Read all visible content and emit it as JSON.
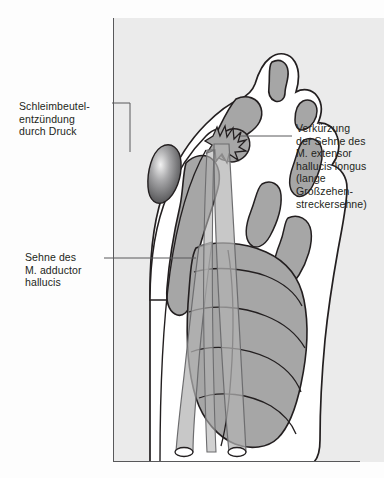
{
  "illustration": {
    "subject": "hallux-valgus-foot-dorsal-view",
    "panel_background": "#ebebeb",
    "page_background": "#fdfdfd",
    "outline_color": "#231f20",
    "bone_fill": "#a6a6a6",
    "soft_tissue_fill": "#ffffff",
    "tendon_fill": "#b3b3b3",
    "bursa_fill": "#58585a",
    "frame_color": "#58585a"
  },
  "labels": {
    "bursa": {
      "text": "Schleimbeutel-\nentzündung\ndurch Druck",
      "leader": "elbow-down-right"
    },
    "adductor": {
      "text": "Sehne des\nM. adductor\nhallucis",
      "leader": "horizontal-right"
    },
    "extensor": {
      "text": "Verkürzung\nder Sehne des\nM. extensor\nhallucis longus\n(lange\nGroßzehen-\nstreckersehne)",
      "leader": "horizontal-left"
    }
  },
  "anatomy": {
    "bones": [
      "distal-phalanx-hallux",
      "proximal-phalanx-hallux",
      "first-metatarsal",
      "second-toe-phalanges",
      "third-toe-phalanges",
      "fourth-toe-phalanges",
      "metatarsals",
      "sesamoid"
    ],
    "structures": [
      "bursa-inflamed",
      "extensor-hallucis-longus-tendon",
      "adductor-hallucis-tendon",
      "tendon-cut-ends"
    ]
  }
}
